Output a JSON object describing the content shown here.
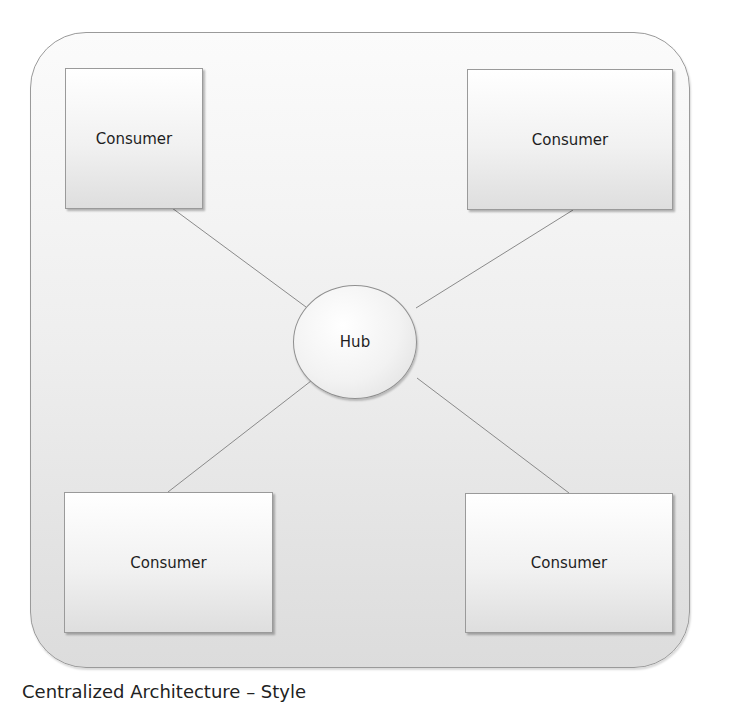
{
  "diagram": {
    "hub": {
      "label": "Hub"
    },
    "consumers": [
      {
        "label": "Consumer",
        "position": "top-left"
      },
      {
        "label": "Consumer",
        "position": "top-right"
      },
      {
        "label": "Consumer",
        "position": "bottom-left"
      },
      {
        "label": "Consumer",
        "position": "bottom-right"
      }
    ],
    "caption": "Centralized Architecture – Style"
  },
  "colors": {
    "border": "#9a9a9a",
    "line": "#8a8a8a",
    "text": "#1e1e1e"
  }
}
